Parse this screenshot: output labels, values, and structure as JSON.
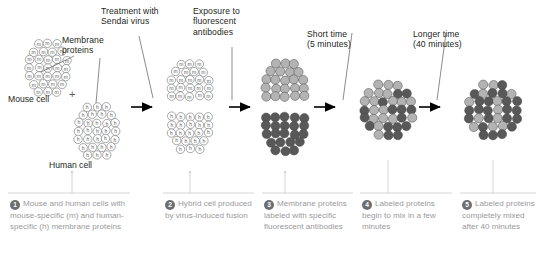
{
  "figure": {
    "colors": {
      "mouse_protein_fill": "#b3b3b3",
      "human_protein_fill": "#585858",
      "outline": "#6d6e71",
      "caption_text": "#9a9a9c",
      "label_text": "#231f20",
      "arrow": "#000000",
      "rule": "#c9c9c9"
    }
  },
  "process_labels": [
    {
      "id": "treatment",
      "text": "Treatment with\nSendai virus"
    },
    {
      "id": "exposure",
      "text": "Exposure to\nfluorescent\nantibodies"
    },
    {
      "id": "short-time",
      "text": "Short time\n(5 minutes)"
    },
    {
      "id": "long-time",
      "text": "Longer time\n(40 minutes)"
    }
  ],
  "annotations": {
    "membrane_proteins": "Membrane\nproteins",
    "mouse_cell": "Mouse cell",
    "human_cell": "Human cell",
    "plus": "+"
  },
  "protein_markers": {
    "mouse": "m",
    "human": "h"
  },
  "captions": [
    {
      "number": "1",
      "text": "Mouse and human cells with mouse-specific (m) and human-specific (h) membrane proteins"
    },
    {
      "number": "2",
      "text": "Hybrid cell produced by virus-induced fusion"
    },
    {
      "number": "3",
      "text": "Membrane proteins labeled with specific fluorescent antibodies"
    },
    {
      "number": "4",
      "text": "Labeled proteins begin to mix in a few minutes"
    },
    {
      "number": "5",
      "text": "Labeled proteins completely mixed after 40 minutes"
    }
  ]
}
